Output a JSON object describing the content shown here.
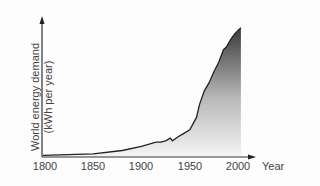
{
  "chart_data": {
    "type": "area",
    "title": "",
    "xlabel": "Year",
    "ylabel": "World energy demand (kWh per year)",
    "ylabel_lines": [
      "World energy demand",
      "(kWh per year)"
    ],
    "x_ticks": [
      "1800",
      "1850",
      "1900",
      "1950",
      "2000"
    ],
    "xlim": [
      1800,
      2005
    ],
    "y_ticks": [],
    "grid": false,
    "legend": null,
    "note": "y values are relative (0-100), axis has no numeric ticks",
    "x": [
      1800,
      1850,
      1880,
      1900,
      1915,
      1920,
      1925,
      1930,
      1932,
      1938,
      1943,
      1950,
      1957,
      1960,
      1965,
      1970,
      1975,
      1980,
      1985,
      1988,
      1992,
      1996,
      2000,
      2003
    ],
    "values": [
      0.5,
      1.5,
      4,
      7,
      10,
      10,
      11,
      13,
      11,
      14,
      16,
      19,
      28,
      37,
      47,
      53,
      61,
      68,
      77,
      79,
      84,
      88,
      91,
      93
    ]
  },
  "axis": {
    "x_title": "Year",
    "y_title_line1": "World energy demand",
    "y_title_line2": "(kWh per year)",
    "ticks": [
      "1800",
      "1850",
      "1900",
      "1950",
      "2000"
    ]
  }
}
